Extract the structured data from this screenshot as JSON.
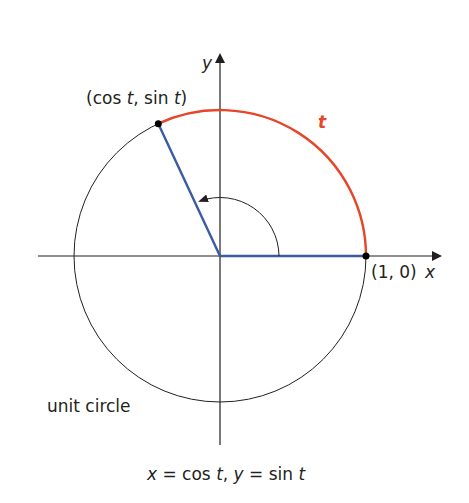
{
  "diagram": {
    "labels": {
      "point_label": "(cos t, sin t)",
      "point_parts": {
        "open": "(cos ",
        "t1": "t",
        "mid": ", sin ",
        "t2": "t",
        "close": ")"
      },
      "arc_label": "t",
      "one_zero": "(1, 0)",
      "x_axis": "x",
      "y_axis": "y",
      "circle_label": "unit circle",
      "equation": "x = cos t, y = sin t",
      "equation_parts": {
        "x": "x",
        "eq1": " = cos ",
        "t1": "t",
        "comma": ", ",
        "y": "y",
        "eq2": " = sin ",
        "t2": "t"
      }
    },
    "colors": {
      "arc": "#e8462a",
      "radius": "#3a5ba0",
      "circle": "#231f20",
      "axes": "#231f20"
    },
    "geometry": {
      "center": [
        220,
        256
      ],
      "radius": 146,
      "angle_deg": 115
    }
  }
}
